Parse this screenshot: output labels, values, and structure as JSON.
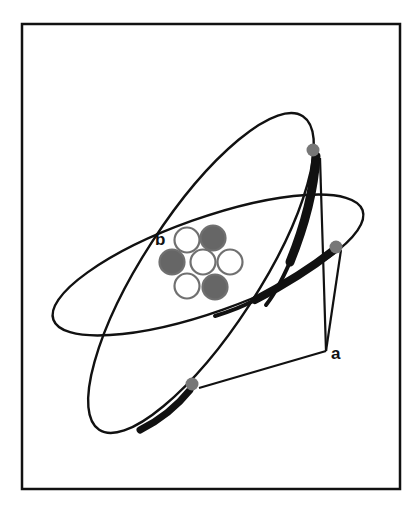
{
  "figure": {
    "type": "atom-model-diagram",
    "labels": {
      "a": "a",
      "b": "b"
    },
    "colors": {
      "stroke": "#111111",
      "electron": "#777777",
      "proton": "#666666",
      "neutron": "#ffffff",
      "nucleon_outline": "#707070",
      "background": "#ffffff"
    }
  },
  "nucleus": {
    "particles": [
      {
        "kind": "neutron",
        "cx": 187,
        "cy": 240
      },
      {
        "kind": "proton",
        "cx": 213,
        "cy": 238
      },
      {
        "kind": "proton",
        "cx": 172,
        "cy": 262
      },
      {
        "kind": "neutron",
        "cx": 203,
        "cy": 262
      },
      {
        "kind": "neutron",
        "cx": 230,
        "cy": 262
      },
      {
        "kind": "neutron",
        "cx": 187,
        "cy": 286
      },
      {
        "kind": "proton",
        "cx": 215,
        "cy": 287
      }
    ]
  },
  "orbits": [
    {
      "name": "tilted-orbit",
      "cx": 201,
      "cy": 273,
      "rx": 187,
      "ry": 58,
      "rotate": -57
    },
    {
      "name": "flat-orbit",
      "cx": 208,
      "cy": 265,
      "rx": 164,
      "ry": 47,
      "rotate": -19.5
    }
  ],
  "electrons": [
    {
      "cx": 313,
      "cy": 150
    },
    {
      "cx": 336,
      "cy": 247
    },
    {
      "cx": 192,
      "cy": 384
    }
  ]
}
